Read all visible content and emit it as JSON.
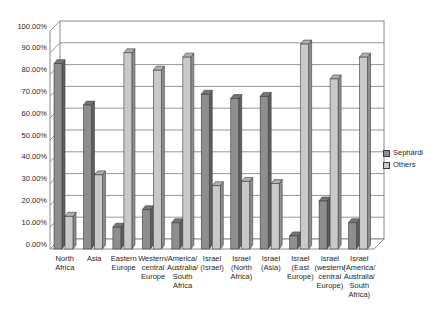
{
  "figure": {
    "kind": "scanned grayscale 3D clustered column chart",
    "background": "#ffffff"
  },
  "chart_data": {
    "type": "bar",
    "style": "3d-clustered-column",
    "title": "",
    "xlabel": "",
    "ylabel": "",
    "grid": true,
    "legend_position": "right",
    "axis_color": "#8a8a8a",
    "bar_outline_color": "#3c3c3c",
    "text_color": "#1f1f1f",
    "y_axis": {
      "min": 0,
      "max": 100,
      "step": 10,
      "unit": "%",
      "tick_labels": [
        "0.00%",
        "10.00%",
        "20.00%",
        "30.00%",
        "40.00%",
        "50.00%",
        "60.00%",
        "70.00%",
        "80.00%",
        "90.00%",
        "100.00%"
      ]
    },
    "categories": [
      "North Africa",
      "Asia",
      "Eastern Europe",
      "Western/central Europe",
      "America/Australia/South Africa",
      "Israel (Israel)",
      "Israel (North Africa)",
      "Israel (Asia)",
      "Israel (East Europe)",
      "Israel (western/central Europe)",
      "Israel (America/Australia/South Africa)"
    ],
    "category_label_lines": [
      [
        "North",
        "Africa"
      ],
      [
        "Asia"
      ],
      [
        "Eastern",
        "Europe"
      ],
      [
        "Western/",
        "central",
        "Europe"
      ],
      [
        "America/",
        "Australia/",
        "South",
        "Africa"
      ],
      [
        "Israel",
        "(Israel)"
      ],
      [
        "Israel",
        "(North",
        "Africa)"
      ],
      [
        "Israel",
        "(Asia)"
      ],
      [
        "Israel",
        "(East",
        "Europe)"
      ],
      [
        "Israel",
        "(western/",
        "central",
        "Europe)"
      ],
      [
        "Israel",
        "(America/",
        "Australia/",
        "South",
        "Africa)"
      ]
    ],
    "series": [
      {
        "name": "Sephardi",
        "color": "#8e8e8e",
        "side_color": "#5f5f5f",
        "top_color": "#767676",
        "values": [
          85,
          66,
          10,
          18,
          12,
          71,
          69,
          70,
          6,
          22,
          12
        ]
      },
      {
        "name": "Others",
        "color": "#c9c9c9",
        "side_color": "#8f8f8f",
        "top_color": "#b0b0b0",
        "values": [
          15,
          34,
          90,
          82,
          88,
          29,
          31,
          30,
          94,
          78,
          88
        ]
      }
    ]
  }
}
